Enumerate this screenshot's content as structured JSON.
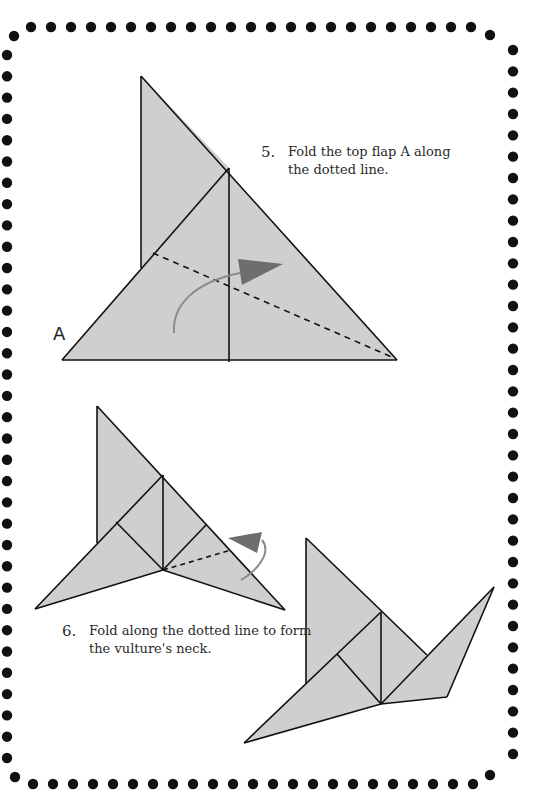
{
  "page": {
    "type": "origami-instructions",
    "border": {
      "style": "dotted",
      "dot_color": "#111111"
    }
  },
  "colors": {
    "paper_fill": "#cfcfcf",
    "edge_stroke": "#111111",
    "arrow_fill": "#6e6e6e",
    "arrow_curve": "#8a8a8a",
    "text": "#2a2a2a"
  },
  "steps": [
    {
      "number": "5.",
      "line1": "Fold the top flap A along",
      "line2": "the dotted line.",
      "flap_label": "A"
    },
    {
      "number": "6.",
      "line1": "Fold along the dotted line to form",
      "line2": "the vulture's neck."
    }
  ],
  "diagrams": [
    {
      "name": "step-5-diagram",
      "description": "triangle with flap A and dashed fold line, curved arrow"
    },
    {
      "name": "step-6-diagram",
      "description": "folded shape with dashed neck fold line and curved arrow"
    },
    {
      "name": "step-6-result-diagram",
      "description": "vulture shape with formed neck"
    }
  ]
}
